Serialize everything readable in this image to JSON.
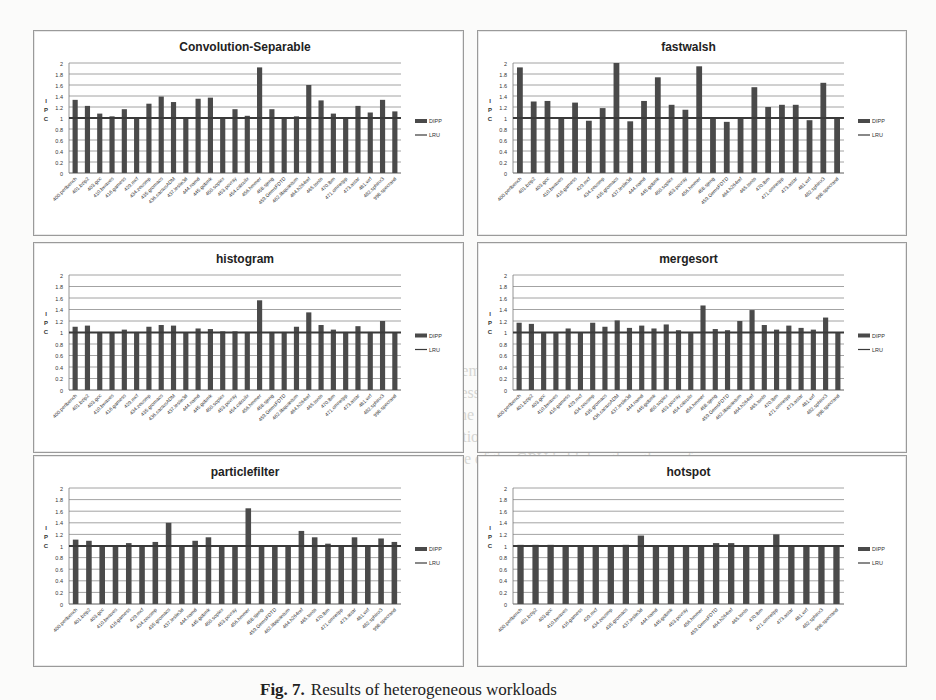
{
  "figure": {
    "caption_label": "Fig. 7.",
    "caption_text": "Results of heterogeneous workloads",
    "background_text": [
      "ates to the memory access frequency. When the GPU application",
      "Memory access frequency of GPU is a intensive property very low. AP and",
      "workloads, the performance is within the level of magnitude of one CPU",
      "GPU application changes when the program runs the performance of",
      "program more of the GPU is higher than the performance"
    ]
  },
  "legend": {
    "bar_label": "DIPP",
    "line_label": "LRU"
  },
  "colors": {
    "bar": "#4a4a4a",
    "line": "#3a3a3a",
    "grid": "#8c8c8c",
    "axis": "#7a7a7a",
    "text": "#333333"
  },
  "chart_data": [
    {
      "type": "bar",
      "title": "Convolution-Separable",
      "ylabel": "IPC",
      "xlabel": "",
      "ylim": [
        0,
        2
      ],
      "yticks": [
        "0",
        "0.2",
        "0.4",
        "0.6",
        "0.8",
        "1",
        "1.2",
        "1.4",
        "1.6",
        "1.8",
        "2"
      ],
      "grid": true,
      "legend_position": "right",
      "baseline_series": {
        "name": "LRU",
        "value": 1.0
      },
      "categories": [
        "400.perlbench",
        "401.bzip2",
        "403.gcc",
        "410.bwaves",
        "416.gamess",
        "429.mcf",
        "434.zeusmp",
        "435.gromacs",
        "436.cactusADM",
        "437.leslie3d",
        "444.namd",
        "445.gobmk",
        "450.soplex",
        "453.povray",
        "454.calculix",
        "456.hmmer",
        "458.sjeng",
        "459.GemsFDTD",
        "462.libquantum",
        "464.h264ref",
        "465.tonto",
        "470.lbm",
        "471.omnetpp",
        "473.astar",
        "481.wrf",
        "482.sphinx3",
        "998.specrand"
      ],
      "series": [
        {
          "name": "DIPP",
          "values": [
            1.33,
            1.22,
            1.08,
            1.03,
            1.16,
            0.99,
            1.26,
            1.39,
            1.29,
            1.0,
            1.35,
            1.37,
            1.0,
            1.16,
            1.04,
            1.92,
            1.16,
            1.0,
            1.03,
            1.6,
            1.32,
            1.08,
            0.99,
            1.22,
            1.1,
            1.33,
            1.12
          ]
        }
      ]
    },
    {
      "type": "bar",
      "title": "fastwalsh",
      "ylabel": "IPC",
      "xlabel": "",
      "ylim": [
        0,
        2
      ],
      "yticks": [
        "0",
        "0.2",
        "0.4",
        "0.6",
        "0.8",
        "1",
        "1.2",
        "1.4",
        "1.6",
        "1.8",
        "2"
      ],
      "grid": true,
      "legend_position": "right",
      "baseline_series": {
        "name": "LRU",
        "value": 1.0
      },
      "categories": [
        "400.perlbench",
        "401.bzip2",
        "403.gcc",
        "410.bwaves",
        "416.gamess",
        "429.mcf",
        "434.zeusmp",
        "435.gromacs",
        "437.leslie3d",
        "444.namd",
        "445.gobmk",
        "450.soplex",
        "453.povray",
        "456.hmmer",
        "458.sjeng",
        "459.GemsFDTD",
        "464.h264ref",
        "465.tonto",
        "470.lbm",
        "471.omnetpp",
        "473.astar",
        "481.wrf",
        "482.sphinx3",
        "998.specrand"
      ],
      "series": [
        {
          "name": "DIPP",
          "values": [
            1.92,
            1.3,
            1.31,
            1.0,
            1.28,
            0.95,
            1.18,
            2.0,
            0.94,
            1.31,
            1.74,
            1.24,
            1.15,
            1.94,
            1.01,
            0.93,
            1.0,
            1.56,
            1.2,
            1.24,
            1.24,
            0.96,
            1.64,
            1.0
          ]
        }
      ]
    },
    {
      "type": "bar",
      "title": "histogram",
      "ylabel": "IPC",
      "xlabel": "",
      "ylim": [
        0,
        2
      ],
      "yticks": [
        "0",
        "0.2",
        "0.4",
        "0.6",
        "0.8",
        "1",
        "1.2",
        "1.4",
        "1.6",
        "1.8",
        "2"
      ],
      "grid": true,
      "legend_position": "right",
      "baseline_series": {
        "name": "LRU",
        "value": 1.0
      },
      "categories": [
        "400.perlbench",
        "401.bzip2",
        "403.gcc",
        "410.bwaves",
        "416.gamess",
        "429.mcf",
        "434.zeusmp",
        "435.gromacs",
        "436.cactusADM",
        "437.leslie3d",
        "444.namd",
        "445.gobmk",
        "450.soplex",
        "453.povray",
        "454.calculix",
        "456.hmmer",
        "458.sjeng",
        "459.GemsFDTD",
        "462.libquantum",
        "464.h264ref",
        "465.tonto",
        "470.lbm",
        "471.omnetpp",
        "473.astar",
        "481.wrf",
        "482.sphinx3",
        "998.specrand"
      ],
      "series": [
        {
          "name": "DIPP",
          "values": [
            1.1,
            1.12,
            1.01,
            1.01,
            1.05,
            1.01,
            1.1,
            1.13,
            1.12,
            1.0,
            1.07,
            1.06,
            1.02,
            1.02,
            1.01,
            1.56,
            1.01,
            1.01,
            1.1,
            1.35,
            1.13,
            1.05,
            1.01,
            1.11,
            1.01,
            1.2,
            1.0
          ]
        }
      ]
    },
    {
      "type": "bar",
      "title": "mergesort",
      "ylabel": "IPC",
      "xlabel": "",
      "ylim": [
        0,
        2
      ],
      "yticks": [
        "0",
        "0.2",
        "0.4",
        "0.6",
        "0.8",
        "1",
        "1.2",
        "1.4",
        "1.6",
        "1.8",
        "2"
      ],
      "grid": true,
      "legend_position": "right",
      "baseline_series": {
        "name": "LRU",
        "value": 1.0
      },
      "categories": [
        "400.perlbench",
        "401.bzip2",
        "403.gcc",
        "410.bwaves",
        "416.gamess",
        "429.mcf",
        "434.zeusmp",
        "435.gromacs",
        "436.cactusADM",
        "437.leslie3d",
        "444.namd",
        "445.gobmk",
        "450.soplex",
        "453.povray",
        "454.calculix",
        "456.hmmer",
        "458.sjeng",
        "459.GemsFDTD",
        "462.libquantum",
        "464.h264ref",
        "465.tonto",
        "470.lbm",
        "471.omnetpp",
        "473.astar",
        "481.wrf",
        "482.sphinx3",
        "998.specrand"
      ],
      "series": [
        {
          "name": "DIPP",
          "values": [
            1.17,
            1.15,
            0.99,
            0.99,
            1.07,
            1.0,
            1.17,
            1.1,
            1.21,
            1.08,
            1.12,
            1.07,
            1.14,
            1.04,
            0.99,
            1.47,
            1.06,
            1.04,
            1.2,
            1.39,
            1.13,
            1.05,
            1.12,
            1.08,
            1.05,
            1.26,
            1.0
          ]
        }
      ]
    },
    {
      "type": "bar",
      "title": "particlefilter",
      "ylabel": "IPC",
      "xlabel": "",
      "ylim": [
        0,
        2
      ],
      "yticks": [
        "0",
        "0.2",
        "0.4",
        "0.6",
        "0.8",
        "1",
        "1.2",
        "1.4",
        "1.6",
        "1.8",
        "2"
      ],
      "grid": true,
      "legend_position": "right",
      "baseline_series": {
        "name": "LRU",
        "value": 1.0
      },
      "categories": [
        "400.perlbench",
        "401.bzip2",
        "403.gcc",
        "410.bwaves",
        "416.gamess",
        "429.mcf",
        "434.zeusmp",
        "435.gromacs",
        "437.leslie3d",
        "444.namd",
        "445.gobmk",
        "450.soplex",
        "453.povray",
        "456.hmmer",
        "458.sjeng",
        "459.GemsFDTD",
        "462.libquantum",
        "464.h264ref",
        "465.tonto",
        "470.lbm",
        "471.omnetpp",
        "473.astar",
        "481.wrf",
        "482.sphinx3",
        "998.specrand"
      ],
      "series": [
        {
          "name": "DIPP",
          "values": [
            1.11,
            1.09,
            1.01,
            1.01,
            1.05,
            1.01,
            1.07,
            1.4,
            1.01,
            1.09,
            1.15,
            1.01,
            1.01,
            1.65,
            1.01,
            1.01,
            1.0,
            1.26,
            1.15,
            1.04,
            1.01,
            1.15,
            1.0,
            1.13,
            1.07
          ]
        }
      ]
    },
    {
      "type": "bar",
      "title": "hotspot",
      "ylabel": "IPC",
      "xlabel": "",
      "ylim": [
        0,
        2
      ],
      "yticks": [
        "0",
        "0.2",
        "0.4",
        "0.6",
        "0.8",
        "1",
        "1.2",
        "1.4",
        "1.6",
        "1.8",
        "2"
      ],
      "grid": true,
      "legend_position": "right",
      "baseline_series": {
        "name": "LRU",
        "value": 1.0
      },
      "categories": [
        "400.perlbench",
        "401.bzip2",
        "403.gcc",
        "410.bwaves",
        "416.gamess",
        "429.mcf",
        "434.zeusmp",
        "435.gromacs",
        "437.leslie3d",
        "444.namd",
        "445.gobmk",
        "453.povray",
        "456.hmmer",
        "459.GemsFDTD",
        "464.h264ref",
        "465.tonto",
        "470.lbm",
        "471.omnetpp",
        "473.astar",
        "481.wrf",
        "482.sphinx3",
        "998.specrand"
      ],
      "series": [
        {
          "name": "DIPP",
          "values": [
            1.02,
            1.02,
            1.02,
            1.01,
            1.01,
            1.01,
            1.01,
            1.02,
            1.18,
            1.01,
            1.01,
            1.01,
            1.01,
            1.05,
            1.05,
            1.01,
            1.01,
            1.2,
            1.01,
            1.01,
            1.01,
            1.01
          ]
        }
      ]
    }
  ]
}
